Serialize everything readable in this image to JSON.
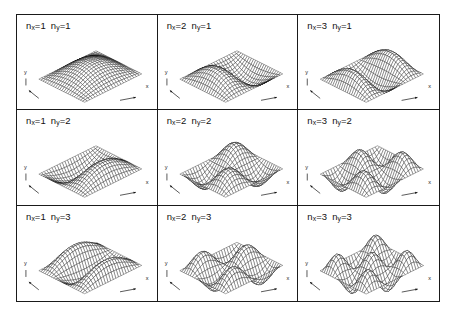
{
  "figure": {
    "type": "wavefunction-surface-grid",
    "rows": 3,
    "columns": 3,
    "line_color": "#111111",
    "background_color": "#ffffff",
    "border_color": "#1a1a1a"
  },
  "axes": {
    "x_label": "x",
    "y_label": "y"
  },
  "panels": [
    {
      "id": "panel-nx1-ny1",
      "nx": 1,
      "ny": 1,
      "label_nx": "n",
      "label_nx_sub": "x",
      "label_nx_value": "=1",
      "label_ny": "n",
      "label_ny_sub": "y",
      "label_ny_value": "=1",
      "lobes": 1
    },
    {
      "id": "panel-nx2-ny1",
      "nx": 2,
      "ny": 1,
      "label_nx": "n",
      "label_nx_sub": "x",
      "label_nx_value": "=2",
      "label_ny": "n",
      "label_ny_sub": "y",
      "label_ny_value": "=1",
      "lobes": 2
    },
    {
      "id": "panel-nx3-ny1",
      "nx": 3,
      "ny": 1,
      "label_nx": "n",
      "label_nx_sub": "x",
      "label_nx_value": "=3",
      "label_ny": "n",
      "label_ny_sub": "y",
      "label_ny_value": "=1",
      "lobes": 3
    },
    {
      "id": "panel-nx1-ny2",
      "nx": 1,
      "ny": 2,
      "label_nx": "n",
      "label_nx_sub": "x",
      "label_nx_value": "=1",
      "label_ny": "n",
      "label_ny_sub": "y",
      "label_ny_value": "=2",
      "lobes": 2
    },
    {
      "id": "panel-nx2-ny2",
      "nx": 2,
      "ny": 2,
      "label_nx": "n",
      "label_nx_sub": "x",
      "label_nx_value": "=2",
      "label_ny": "n",
      "label_ny_sub": "y",
      "label_ny_value": "=2",
      "lobes": 4
    },
    {
      "id": "panel-nx3-ny2",
      "nx": 3,
      "ny": 2,
      "label_nx": "n",
      "label_nx_sub": "x",
      "label_nx_value": "=3",
      "label_ny": "n",
      "label_ny_sub": "y",
      "label_ny_value": "=2",
      "lobes": 6
    },
    {
      "id": "panel-nx1-ny3",
      "nx": 1,
      "ny": 3,
      "label_nx": "n",
      "label_nx_sub": "x",
      "label_nx_value": "=1",
      "label_ny": "n",
      "label_ny_sub": "y",
      "label_ny_value": "=3",
      "lobes": 3
    },
    {
      "id": "panel-nx2-ny3",
      "nx": 2,
      "ny": 3,
      "label_nx": "n",
      "label_nx_sub": "x",
      "label_nx_value": "=2",
      "label_ny": "n",
      "label_ny_sub": "y",
      "label_ny_value": "=3",
      "lobes": 6
    },
    {
      "id": "panel-nx3-ny3",
      "nx": 3,
      "ny": 3,
      "label_nx": "n",
      "label_nx_sub": "x",
      "label_nx_value": "=3",
      "label_ny": "n",
      "label_ny_sub": "y",
      "label_ny_value": "=3",
      "lobes": 9
    }
  ],
  "chart_data": {
    "type": "surface-grid",
    "title": "",
    "function": "psi(x,y) = sin(nx*pi*x) * sin(ny*pi*y)",
    "xlabel": "x",
    "ylabel": "y",
    "zlabel": "",
    "xlim": [
      0,
      1
    ],
    "ylim": [
      0,
      1
    ],
    "zlim": [
      -1,
      1
    ],
    "grid": false,
    "legend": "none",
    "mesh_resolution": 24,
    "projection": "isometric",
    "series": [
      {
        "name": "nx=1 ny=1",
        "nx": 1,
        "ny": 1,
        "nodes_x": 0,
        "nodes_y": 0,
        "extrema": 1
      },
      {
        "name": "nx=2 ny=1",
        "nx": 2,
        "ny": 1,
        "nodes_x": 1,
        "nodes_y": 0,
        "extrema": 2
      },
      {
        "name": "nx=3 ny=1",
        "nx": 3,
        "ny": 1,
        "nodes_x": 2,
        "nodes_y": 0,
        "extrema": 3
      },
      {
        "name": "nx=1 ny=2",
        "nx": 1,
        "ny": 2,
        "nodes_x": 0,
        "nodes_y": 1,
        "extrema": 2
      },
      {
        "name": "nx=2 ny=2",
        "nx": 2,
        "ny": 2,
        "nodes_x": 1,
        "nodes_y": 1,
        "extrema": 4
      },
      {
        "name": "nx=3 ny=2",
        "nx": 3,
        "ny": 2,
        "nodes_x": 2,
        "nodes_y": 1,
        "extrema": 6
      },
      {
        "name": "nx=1 ny=3",
        "nx": 1,
        "ny": 3,
        "nodes_x": 0,
        "nodes_y": 2,
        "extrema": 3
      },
      {
        "name": "nx=2 ny=3",
        "nx": 2,
        "ny": 3,
        "nodes_x": 1,
        "nodes_y": 2,
        "extrema": 6
      },
      {
        "name": "nx=3 ny=3",
        "nx": 3,
        "ny": 3,
        "nodes_x": 2,
        "nodes_y": 2,
        "extrema": 9
      }
    ]
  }
}
